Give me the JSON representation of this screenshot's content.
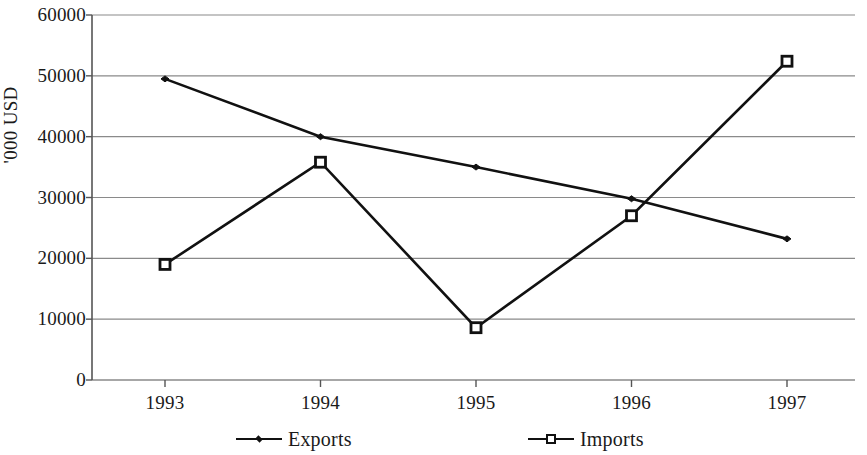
{
  "chart_data": {
    "type": "line",
    "title": "",
    "subtitle": "",
    "xlabel": "",
    "ylabel": "'000 USD",
    "categories": [
      "1993",
      "1994",
      "1995",
      "1996",
      "1997"
    ],
    "x_tick_labels": [
      "1993",
      "1994",
      "1995",
      "1996",
      "1997"
    ],
    "y_tick_labels": [
      "0",
      "10000",
      "20000",
      "30000",
      "40000",
      "50000",
      "60000"
    ],
    "y_ticks": [
      0,
      10000,
      20000,
      30000,
      40000,
      50000,
      60000
    ],
    "ylim": [
      0,
      60000
    ],
    "grid": "horizontal",
    "legend_position": "bottom",
    "series": [
      {
        "name": "Exports",
        "marker": "diamond",
        "color": "#111111",
        "values": [
          49500,
          40000,
          35000,
          29800,
          23200
        ]
      },
      {
        "name": "Imports",
        "marker": "square",
        "color": "#111111",
        "values": [
          19000,
          35800,
          8600,
          27000,
          52400
        ]
      }
    ],
    "legend": [
      "Exports",
      "Imports"
    ],
    "annotations": []
  },
  "axis": {
    "y_title": "'000 USD"
  },
  "colors": {
    "line": "#111111",
    "grid": "#8a8a8a",
    "axis": "#555555",
    "background": "#ffffff"
  }
}
